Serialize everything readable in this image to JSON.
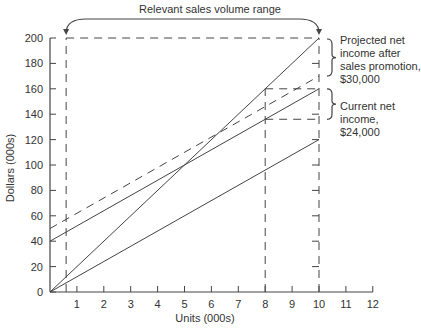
{
  "chart_data": {
    "type": "line",
    "title": "Relevant sales volume range",
    "xlabel": "Units (000s)",
    "ylabel": "Dollars (000s)",
    "xlim": [
      0,
      12
    ],
    "ylim": [
      0,
      200
    ],
    "x_ticks": [
      1,
      2,
      3,
      4,
      5,
      6,
      7,
      8,
      9,
      10,
      11,
      12
    ],
    "y_ticks": [
      0,
      20,
      40,
      60,
      80,
      100,
      120,
      140,
      160,
      180,
      200
    ],
    "grid": false,
    "series": [
      {
        "name": "Sales revenue",
        "style": "solid",
        "x": [
          0,
          10
        ],
        "y": [
          0,
          200
        ]
      },
      {
        "name": "Total cost (current)",
        "style": "solid",
        "x": [
          0,
          10
        ],
        "y": [
          40,
          160
        ]
      },
      {
        "name": "Variable cost",
        "style": "solid",
        "x": [
          0,
          10
        ],
        "y": [
          0,
          120
        ]
      },
      {
        "name": "Total cost (after sales promotion)",
        "style": "dashed",
        "x": [
          0,
          10
        ],
        "y": [
          50,
          170
        ]
      }
    ],
    "reference_lines": [
      {
        "type": "vertical",
        "x": 0.6,
        "style": "dashed"
      },
      {
        "type": "vertical",
        "x": 8,
        "style": "dashed"
      },
      {
        "type": "vertical",
        "x": 10,
        "style": "dashed"
      },
      {
        "type": "horizontal",
        "y": 200,
        "from_x": 0.6,
        "to_x": 10,
        "style": "dashed"
      },
      {
        "type": "horizontal",
        "y": 160,
        "from_x": 8,
        "to_x": 10,
        "style": "dashed"
      },
      {
        "type": "horizontal",
        "y": 136,
        "from_x": 8,
        "to_x": 10,
        "style": "dashed"
      }
    ],
    "annotations": [
      {
        "text": "Projected net income after sales promotion, $30,000",
        "x": 10,
        "y_range": [
          170,
          200
        ]
      },
      {
        "text": "Current net income, $24,000",
        "x": 10,
        "y_range": [
          136,
          160
        ]
      },
      {
        "text": "Relevant sales volume range",
        "x_range": [
          0.6,
          10
        ]
      }
    ]
  },
  "labels": {
    "title": "Relevant sales volume range",
    "xlabel": "Units (000s)",
    "ylabel": "Dollars (000s)",
    "projected_line1": "Projected net",
    "projected_line2": "income after",
    "projected_line3": "sales promotion,",
    "projected_line4": "$30,000",
    "current_line1": "Current net",
    "current_line2": "income, $24,000"
  }
}
